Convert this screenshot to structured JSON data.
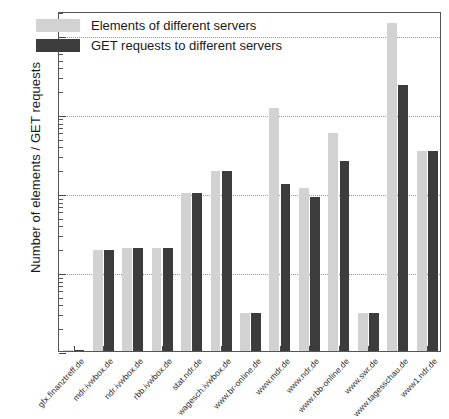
{
  "chart_data": {
    "type": "bar",
    "title": "",
    "xlabel": "",
    "ylabel": "Number of elements / GET requests",
    "yscale": "log",
    "ylim": [
      1,
      20000
    ],
    "grid": true,
    "legend_position": "top-left",
    "ytick_labels": [
      "1",
      "10",
      "100",
      "1000",
      "10000"
    ],
    "ytick_values": [
      1,
      10,
      100,
      1000,
      10000
    ],
    "categories": [
      "gfx.finanztreff.de",
      "mdr.ivwbox.de",
      "ndr.ivwbox.de",
      "rbb.ivwbox.de",
      "stat.ndr.de",
      "wagesch.ivwbox.de",
      "www.br-online.de",
      "www.mdr.de",
      "www.ndr.de",
      "www.rbb-online.de",
      "www.swr.de",
      "www.tagesschau.de",
      "www1.ndr.de"
    ],
    "series": [
      {
        "name": "Elements of different servers",
        "color": "#d2d2d2",
        "values": [
          1,
          19,
          20,
          20,
          100,
          190,
          3,
          1200,
          115,
          570,
          3,
          14000,
          340
        ]
      },
      {
        "name": "GET requests to different servers",
        "color": "#3c3c3c",
        "values": [
          1,
          19,
          20,
          20,
          100,
          190,
          3,
          130,
          90,
          250,
          3,
          2300,
          340
        ]
      }
    ]
  }
}
